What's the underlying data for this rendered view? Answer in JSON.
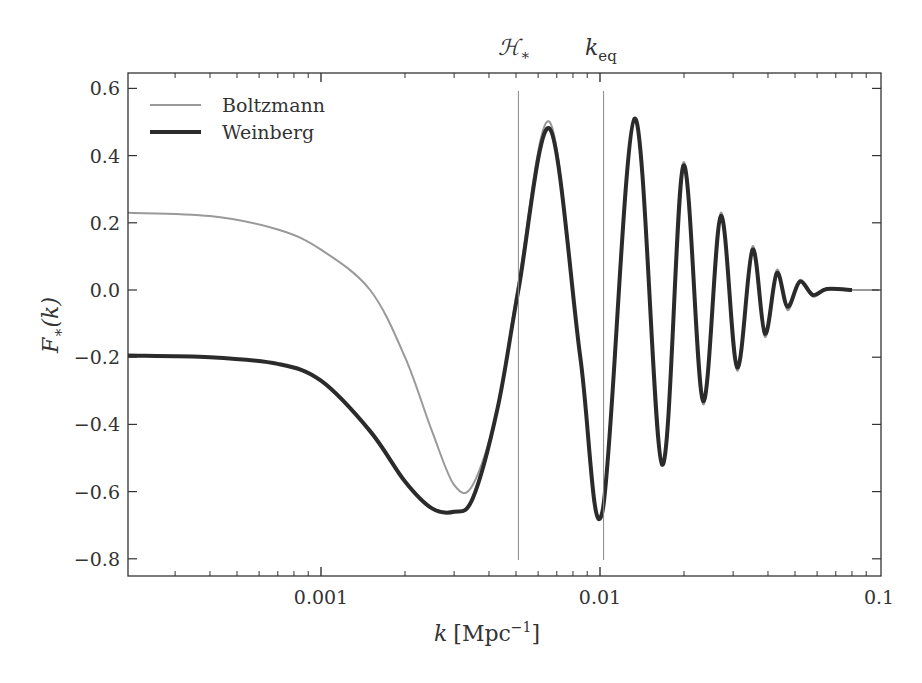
{
  "chart_data": {
    "type": "line",
    "title": "",
    "xlabel": "k [Mpc^-1]",
    "ylabel": "F_*(k)",
    "xscale": "log",
    "xlim": [
      0.0002,
      0.1
    ],
    "ylim": [
      -0.85,
      0.65
    ],
    "grid": false,
    "legend_position": "upper left",
    "x_ticks": [
      "0.001",
      "0.01",
      "0.1"
    ],
    "y_ticks": [
      "0.6",
      "0.4",
      "0.2",
      "0.0",
      "−0.2",
      "−0.4",
      "−0.6",
      "−0.8"
    ],
    "annotations": [
      {
        "label": "H_*",
        "display": "ℋ∗",
        "k": 0.0051,
        "type": "vertical-line"
      },
      {
        "label": "k_eq",
        "display": "k",
        "sub": "eq",
        "k": 0.0103,
        "type": "vertical-line"
      }
    ],
    "series": [
      {
        "name": "Boltzmann",
        "color": "#999999",
        "linewidth": 2,
        "k": [
          0.0002,
          0.0004,
          0.0007,
          0.001,
          0.0015,
          0.002,
          0.0025,
          0.003,
          0.0035,
          0.0043,
          0.0051,
          0.0066,
          0.0085,
          0.0102,
          0.0133,
          0.0167,
          0.0199,
          0.0234,
          0.0271,
          0.031,
          0.0352,
          0.039,
          0.043,
          0.047,
          0.052,
          0.058,
          0.065,
          0.075,
          0.1
        ],
        "F": [
          0.23,
          0.22,
          0.18,
          0.12,
          0.0,
          -0.2,
          -0.42,
          -0.58,
          -0.58,
          -0.35,
          0.02,
          0.5,
          -0.2,
          -0.66,
          0.51,
          -0.52,
          0.38,
          -0.34,
          0.23,
          -0.24,
          0.13,
          -0.14,
          0.06,
          -0.06,
          0.03,
          -0.02,
          0.005,
          0.0,
          0.0
        ]
      },
      {
        "name": "Weinberg",
        "color": "#2b2b2b",
        "linewidth": 4,
        "k": [
          0.0002,
          0.0004,
          0.0007,
          0.001,
          0.0015,
          0.002,
          0.0025,
          0.003,
          0.0035,
          0.0043,
          0.0051,
          0.0066,
          0.0085,
          0.0102,
          0.0133,
          0.0167,
          0.0199,
          0.0234,
          0.0271,
          0.031,
          0.0352,
          0.039,
          0.043,
          0.047,
          0.052,
          0.058,
          0.065,
          0.08
        ],
        "F": [
          -0.195,
          -0.2,
          -0.22,
          -0.27,
          -0.42,
          -0.57,
          -0.65,
          -0.66,
          -0.62,
          -0.35,
          0.0,
          0.48,
          -0.2,
          -0.66,
          0.51,
          -0.52,
          0.37,
          -0.33,
          0.22,
          -0.23,
          0.12,
          -0.13,
          0.05,
          -0.05,
          0.025,
          -0.015,
          0.003,
          0.0
        ]
      }
    ]
  },
  "legend": {
    "items": [
      {
        "label": "Boltzmann",
        "color": "#999999"
      },
      {
        "label": "Weinberg",
        "color": "#2b2b2b"
      }
    ]
  },
  "axes": {
    "xlabel_k": "k",
    "xlabel_unit": "[Mpc",
    "xlabel_exp": "−1",
    "xlabel_close": "]",
    "ylabel_F": "F",
    "ylabel_sub": "∗",
    "ylabel_arg": "(k)"
  },
  "top_labels": {
    "h_star": "ℋ",
    "h_star_sub": "∗",
    "k_eq": "k",
    "k_eq_sub": "eq"
  }
}
